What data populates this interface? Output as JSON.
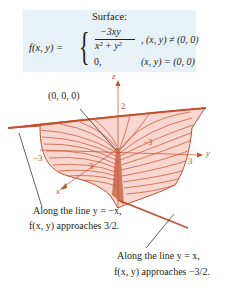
{
  "formula": {
    "title": "Surface:",
    "lhs": "f(x, y) =",
    "numerator": "−3xy",
    "denominator": "x² + y²",
    "case1_condition": ", (x, y) ≠ (0, 0)",
    "case2_value": "0,",
    "case2_condition": "(x, y) = (0, 0)",
    "background": "#e8f1f6"
  },
  "plot": {
    "axes": {
      "x": "x",
      "y": "y",
      "z": "z"
    },
    "ticks": {
      "z2": "2",
      "xneg3": "−3",
      "x3": "3",
      "y3": "3",
      "yneg3": "−3"
    },
    "surface_fill": "#f9d6cf",
    "surface_line": "#c0502e",
    "origin_label": "(0, 0, 0)"
  },
  "annotations": [
    {
      "line1": "Along the line y = −x,",
      "line2": "f(x, y) approaches 3/2."
    },
    {
      "line1": "Along the line y = x,",
      "line2": "f(x, y) approaches −3/2."
    }
  ]
}
